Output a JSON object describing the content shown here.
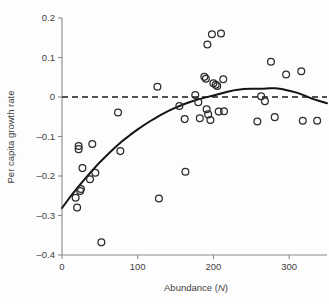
{
  "chart_data": {
    "type": "scatter",
    "title": "",
    "xlabel": "Abundance (N)",
    "xlabel_plain": "Abundance (",
    "xlabel_italic": "N",
    "xlabel_close": ")",
    "ylabel": "Per capita growth rate",
    "xlim": [
      0,
      350
    ],
    "ylim": [
      -0.4,
      0.2
    ],
    "grid": false,
    "legend": "none",
    "xticks": [
      0,
      100,
      200,
      300
    ],
    "xtick_labels": [
      "0",
      "100",
      "200",
      "300"
    ],
    "yticks": [
      0.2,
      0.1,
      0,
      -0.1,
      -0.2,
      -0.3,
      -0.4
    ],
    "ytick_labels": [
      "0.2",
      "0.1",
      "0",
      "–0.1",
      "–0.2",
      "–0.3",
      "–0.4"
    ],
    "reference_line": {
      "type": "horizontal-dashed",
      "y": 0,
      "label": "zero growth"
    },
    "series": [
      {
        "name": "observations",
        "marker": "open-circle",
        "color": "#2b2b2b",
        "points": [
          [
            18,
            -0.255
          ],
          [
            20,
            -0.28
          ],
          [
            22,
            -0.132
          ],
          [
            22,
            -0.124
          ],
          [
            24,
            -0.238
          ],
          [
            25,
            -0.233
          ],
          [
            27,
            -0.18
          ],
          [
            37,
            -0.208
          ],
          [
            40,
            -0.119
          ],
          [
            44,
            -0.192
          ],
          [
            52,
            -0.368
          ],
          [
            74,
            -0.039
          ],
          [
            77,
            -0.137
          ],
          [
            126,
            0.026
          ],
          [
            128,
            -0.257
          ],
          [
            155,
            -0.023
          ],
          [
            162,
            -0.056
          ],
          [
            163,
            -0.189
          ],
          [
            176,
            0.005
          ],
          [
            180,
            -0.013
          ],
          [
            182,
            -0.054
          ],
          [
            188,
            0.051
          ],
          [
            190,
            0.046
          ],
          [
            191,
            -0.031
          ],
          [
            192,
            0.133
          ],
          [
            193,
            -0.044
          ],
          [
            196,
            -0.058
          ],
          [
            198,
            0.159
          ],
          [
            200,
            0.035
          ],
          [
            203,
            0.031
          ],
          [
            205,
            0.028
          ],
          [
            207,
            -0.037
          ],
          [
            210,
            0.161
          ],
          [
            213,
            0.045
          ],
          [
            214,
            -0.036
          ],
          [
            258,
            -0.062
          ],
          [
            263,
            0.002
          ],
          [
            268,
            -0.011
          ],
          [
            276,
            0.089
          ],
          [
            281,
            -0.051
          ],
          [
            296,
            0.057
          ],
          [
            316,
            0.065
          ],
          [
            318,
            -0.06
          ],
          [
            337,
            -0.06
          ]
        ]
      }
    ],
    "fit_curve": {
      "name": "fitted-density-dependence-curve",
      "style": "solid",
      "color": "#141414",
      "points": [
        [
          0,
          -0.281
        ],
        [
          10,
          -0.255
        ],
        [
          20,
          -0.231
        ],
        [
          30,
          -0.208
        ],
        [
          40,
          -0.186
        ],
        [
          50,
          -0.165
        ],
        [
          60,
          -0.146
        ],
        [
          70,
          -0.128
        ],
        [
          80,
          -0.111
        ],
        [
          90,
          -0.096
        ],
        [
          100,
          -0.082
        ],
        [
          110,
          -0.069
        ],
        [
          120,
          -0.057
        ],
        [
          130,
          -0.046
        ],
        [
          140,
          -0.036
        ],
        [
          150,
          -0.027
        ],
        [
          160,
          -0.019
        ],
        [
          170,
          -0.012
        ],
        [
          180,
          -0.006
        ],
        [
          190,
          -0.001
        ],
        [
          200,
          0.004
        ],
        [
          210,
          0.009
        ],
        [
          220,
          0.014
        ],
        [
          230,
          0.018
        ],
        [
          240,
          0.02
        ],
        [
          250,
          0.021
        ],
        [
          258,
          0.021
        ],
        [
          266,
          0.021
        ],
        [
          274,
          0.022
        ],
        [
          282,
          0.022
        ],
        [
          290,
          0.02
        ],
        [
          300,
          0.016
        ],
        [
          310,
          0.011
        ],
        [
          320,
          0.004
        ],
        [
          330,
          -0.004
        ],
        [
          340,
          -0.01
        ],
        [
          350,
          -0.016
        ]
      ]
    }
  }
}
